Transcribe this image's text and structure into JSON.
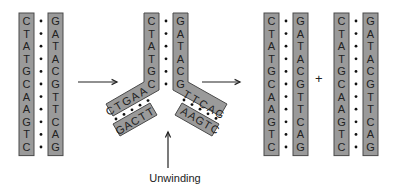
{
  "diagram": {
    "original": {
      "left_strand": [
        "C",
        "T",
        "A",
        "T",
        "G",
        "C",
        "A",
        "A",
        "G",
        "T",
        "C"
      ],
      "right_strand": [
        "G",
        "A",
        "T",
        "A",
        "C",
        "G",
        "T",
        "T",
        "C",
        "A",
        "G"
      ]
    },
    "fork": {
      "paired_left": [
        "C",
        "T",
        "A",
        "T",
        "G",
        "C"
      ],
      "paired_right": [
        "G",
        "A",
        "T",
        "A",
        "C",
        "G"
      ],
      "left_arm_parent": [
        "A",
        "A",
        "G",
        "T",
        "C"
      ],
      "left_arm_new": [
        "T",
        "T",
        "C",
        "A",
        "G"
      ],
      "right_arm_parent": [
        "T",
        "T",
        "C",
        "A",
        "G"
      ],
      "right_arm_new": [
        "A",
        "A",
        "G",
        "T",
        "C"
      ]
    },
    "products": [
      {
        "left_strand": [
          "C",
          "T",
          "A",
          "T",
          "G",
          "C",
          "A",
          "A",
          "G",
          "T",
          "C"
        ],
        "right_strand": [
          "G",
          "A",
          "T",
          "A",
          "C",
          "G",
          "T",
          "T",
          "C",
          "A",
          "G"
        ]
      },
      {
        "left_strand": [
          "C",
          "T",
          "A",
          "T",
          "G",
          "C",
          "A",
          "A",
          "G",
          "T",
          "C"
        ],
        "right_strand": [
          "G",
          "A",
          "T",
          "A",
          "C",
          "G",
          "T",
          "T",
          "C",
          "A",
          "G"
        ]
      }
    ],
    "plus_sign": "+",
    "unwinding_label": "Unwinding",
    "colors": {
      "strand_fill": "#9a9a9a",
      "strand_stroke": "#4a4a4a",
      "text": "#222222"
    }
  }
}
